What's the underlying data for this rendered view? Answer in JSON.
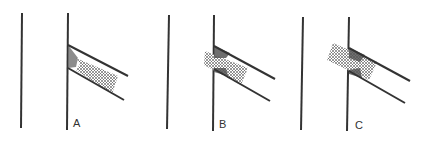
{
  "diagram": {
    "colors": {
      "line": "#333333",
      "hatch": "#555555",
      "shade": "#444444"
    },
    "panels": [
      {
        "label": "A",
        "x_offset": 0,
        "hatch_position": "between-diagonals",
        "description": "Hatched region lies to the right of the vertical line, between the two diagonal lines"
      },
      {
        "label": "B",
        "x_offset": 146,
        "hatch_position": "straddling-line",
        "description": "Hatched region straddles the vertical line, partly extending to the left"
      },
      {
        "label": "C",
        "x_offset": 281,
        "hatch_position": "mostly-left",
        "description": "Hatched region extends further left across the vertical line"
      }
    ]
  }
}
